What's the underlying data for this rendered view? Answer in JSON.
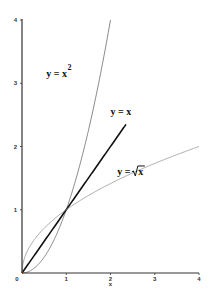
{
  "chart_data": {
    "type": "line",
    "title": "",
    "xlabel": "x",
    "ylabel": "",
    "xlim": [
      0,
      4
    ],
    "ylim": [
      0,
      4
    ],
    "grid": false,
    "x_ticks": [
      {
        "value": 0,
        "label": "0"
      },
      {
        "value": 1,
        "label": "1"
      },
      {
        "value": 2,
        "label": "2"
      },
      {
        "value": 3,
        "label": "3"
      },
      {
        "value": 4,
        "label": "4"
      }
    ],
    "y_ticks": [
      {
        "value": 1,
        "label": "1"
      },
      {
        "value": 2,
        "label": "2"
      },
      {
        "value": 3,
        "label": "3"
      },
      {
        "value": 4,
        "label": "4"
      }
    ],
    "series": [
      {
        "name": "y = x^2",
        "function": "x^2",
        "x_range": [
          0,
          2
        ],
        "style": "thin",
        "color": "#555555"
      },
      {
        "name": "y = x",
        "function": "x",
        "x_range": [
          0,
          2.35
        ],
        "style": "thick",
        "color": "#111111"
      },
      {
        "name": "y = sqrt(x)",
        "function": "sqrt(x)",
        "x_range": [
          0,
          4
        ],
        "style": "thin",
        "color": "#888888"
      }
    ],
    "annotations": [
      {
        "id": "square",
        "text_main": "y =  x",
        "text_sup": "2",
        "x": 0.55,
        "y": 3.1
      },
      {
        "id": "identity",
        "text_main": "y =  x",
        "x": 2.0,
        "y": 2.5
      },
      {
        "id": "sqrt",
        "text_main": "y =",
        "text_radicand": "x",
        "x": 2.15,
        "y": 1.55
      }
    ],
    "legend": "none"
  }
}
